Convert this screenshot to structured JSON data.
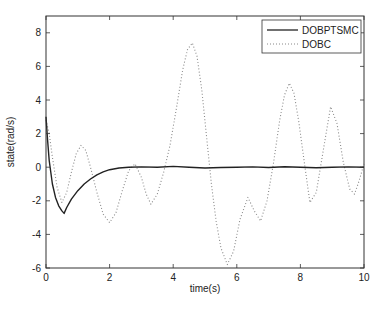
{
  "chart_data": {
    "type": "line",
    "title": "",
    "xlabel": "time(s)",
    "ylabel": "state(rad/s)",
    "xlim": [
      0,
      10
    ],
    "ylim": [
      -6,
      9
    ],
    "xticks": [
      0,
      2,
      4,
      6,
      8,
      10
    ],
    "yticks": [
      -6,
      -4,
      -2,
      0,
      2,
      4,
      6,
      8
    ],
    "grid": false,
    "legend_position": "upper right",
    "series": [
      {
        "name": "DOBPTSMC",
        "style": "solid",
        "color": "#222222",
        "x": [
          0,
          0.05,
          0.1,
          0.2,
          0.3,
          0.4,
          0.5,
          0.57,
          0.65,
          0.8,
          1.0,
          1.2,
          1.4,
          1.6,
          1.8,
          2.0,
          2.3,
          2.6,
          3.0,
          3.5,
          4.0,
          4.5,
          5.0,
          5.5,
          6.0,
          6.5,
          7.0,
          7.5,
          8.0,
          8.5,
          9.0,
          9.5,
          10.0
        ],
        "y": [
          3.0,
          1.6,
          0.4,
          -1.0,
          -1.8,
          -2.3,
          -2.6,
          -2.75,
          -2.4,
          -1.9,
          -1.4,
          -1.0,
          -0.7,
          -0.45,
          -0.28,
          -0.15,
          -0.05,
          0.0,
          0.02,
          0.0,
          0.05,
          0.0,
          -0.05,
          -0.02,
          0.0,
          0.02,
          -0.02,
          0.03,
          0.0,
          -0.03,
          0.0,
          0.02,
          0.0
        ]
      },
      {
        "name": "DOBC",
        "style": "dotted",
        "color": "#888888",
        "x": [
          0,
          0.1,
          0.2,
          0.35,
          0.5,
          0.65,
          0.8,
          0.95,
          1.1,
          1.25,
          1.4,
          1.6,
          1.8,
          2.0,
          2.2,
          2.4,
          2.6,
          2.8,
          3.0,
          3.15,
          3.3,
          3.5,
          3.7,
          3.9,
          4.1,
          4.3,
          4.45,
          4.6,
          4.75,
          4.9,
          5.05,
          5.2,
          5.35,
          5.5,
          5.7,
          5.9,
          6.1,
          6.35,
          6.55,
          6.75,
          6.95,
          7.15,
          7.35,
          7.5,
          7.65,
          7.8,
          7.95,
          8.1,
          8.3,
          8.5,
          8.7,
          8.95,
          9.15,
          9.35,
          9.55,
          9.7,
          9.85,
          10.0
        ],
        "y": [
          2.8,
          2.0,
          0.6,
          -1.2,
          -2.1,
          -1.5,
          -0.3,
          0.8,
          1.3,
          1.0,
          0.0,
          -1.5,
          -2.8,
          -3.3,
          -2.7,
          -1.4,
          -0.2,
          0.2,
          -0.6,
          -1.6,
          -2.2,
          -1.6,
          -0.3,
          1.3,
          3.5,
          5.8,
          7.0,
          7.4,
          6.6,
          4.6,
          1.8,
          -1.0,
          -3.2,
          -4.8,
          -5.8,
          -5.0,
          -3.1,
          -1.8,
          -2.6,
          -3.2,
          -2.0,
          0.2,
          2.8,
          4.3,
          5.0,
          4.4,
          2.7,
          0.6,
          -2.1,
          -1.5,
          0.8,
          3.6,
          2.6,
          0.3,
          -1.3,
          -1.6,
          -0.8,
          0.2
        ]
      }
    ]
  },
  "axes": {
    "xlabel": "time(s)",
    "ylabel": "state(rad/s)"
  },
  "legend": {
    "items": [
      {
        "label": "DOBPTSMC"
      },
      {
        "label": "DOBC"
      }
    ]
  }
}
